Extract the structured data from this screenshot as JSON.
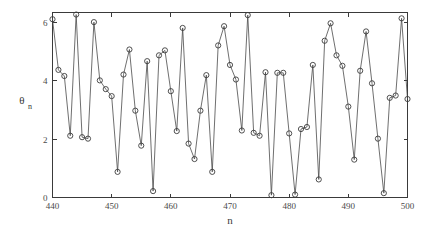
{
  "chart_data": {
    "type": "line",
    "title": "",
    "subtitle": "",
    "xlabel": "n",
    "ylabel": "θ",
    "ylabel_subscript": "n",
    "xlim": [
      440,
      500
    ],
    "ylim": [
      0,
      6.35
    ],
    "xticks": [
      440,
      450,
      460,
      470,
      480,
      490,
      500
    ],
    "xtick_labels": [
      "440",
      "450",
      "460",
      "470",
      "480",
      "490",
      "500"
    ],
    "yticks": [
      0,
      2,
      4,
      6
    ],
    "ytick_labels": [
      "0",
      "2",
      "4",
      "6"
    ],
    "grid": false,
    "legend": null,
    "marker": "open-circle",
    "line_color": "#4a4a4a",
    "marker_color": "#3c3c3c",
    "axis_color": "#3a3a3a",
    "background_color": "#ffffff",
    "x": [
      440,
      441,
      442,
      443,
      444,
      445,
      446,
      447,
      448,
      449,
      450,
      451,
      452,
      453,
      454,
      455,
      456,
      457,
      458,
      459,
      460,
      461,
      462,
      463,
      464,
      465,
      466,
      467,
      468,
      469,
      470,
      471,
      472,
      473,
      474,
      475,
      476,
      477,
      478,
      479,
      480,
      481,
      482,
      483,
      484,
      485,
      486,
      487,
      488,
      489,
      490,
      491,
      492,
      493,
      494,
      495,
      496,
      497,
      498,
      499,
      500
    ],
    "values": [
      6.12,
      4.38,
      4.17,
      2.12,
      6.28,
      2.07,
      2.02,
      6.02,
      4.02,
      3.72,
      3.48,
      0.88,
      4.22,
      5.08,
      2.98,
      1.78,
      4.68,
      0.22,
      4.88,
      5.05,
      3.65,
      2.28,
      5.82,
      1.85,
      1.32,
      2.98,
      4.2,
      0.88,
      5.22,
      5.88,
      4.55,
      4.05,
      2.3,
      6.26,
      2.22,
      2.12,
      4.3,
      0.08,
      4.28,
      4.28,
      2.2,
      0.1,
      2.35,
      2.42,
      4.55,
      0.62,
      5.38,
      5.98,
      4.88,
      4.52,
      3.12,
      1.3,
      4.35,
      5.7,
      3.92,
      2.02,
      0.15,
      3.42,
      3.5,
      6.15,
      3.38
    ]
  }
}
